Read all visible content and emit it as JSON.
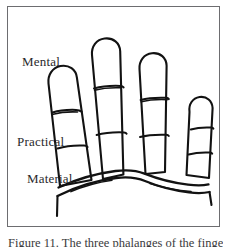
{
  "figure": {
    "alt_description": "Hand-drawn line illustration of four fingers viewed from the palm side, each divided into three phalanges by crease lines, with the horizontal bands labelled from top to bottom.",
    "frame": {
      "border_color": "#6d6d70",
      "background_color": "#ffffff"
    },
    "ink_color": "#121212",
    "zone_labels": [
      {
        "id": "mental",
        "text": "Mental"
      },
      {
        "id": "practical",
        "text": "Practical"
      },
      {
        "id": "material",
        "text": "Material"
      }
    ],
    "caption": "Figure 11. The three phalanges of the fingers.",
    "fingers": [
      {
        "name": "index",
        "segments": [
          "mental",
          "practical",
          "material"
        ],
        "tilt": "leaning-right"
      },
      {
        "name": "middle",
        "segments": [
          "mental",
          "practical",
          "material"
        ],
        "tilt": "upright"
      },
      {
        "name": "ring",
        "segments": [
          "mental",
          "practical",
          "material"
        ],
        "tilt": "upright"
      },
      {
        "name": "little",
        "segments": [
          "mental",
          "practical",
          "material"
        ],
        "tilt": "leaning-left"
      }
    ]
  }
}
